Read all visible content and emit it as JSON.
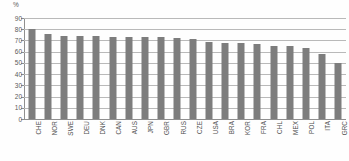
{
  "chart_data": {
    "type": "bar",
    "title": "",
    "subtitle": "",
    "xlabel": "",
    "ylabel": "%",
    "unit_label": "%",
    "ylim": [
      0,
      90
    ],
    "y_ticks": [
      0,
      10,
      20,
      30,
      40,
      50,
      60,
      70,
      80,
      90
    ],
    "y_tick_labels": [
      "0",
      "10",
      "20",
      "30",
      "40",
      "50",
      "60",
      "70",
      "80",
      "90"
    ],
    "grid": true,
    "grid_axis": "y",
    "legend": false,
    "legend_position": "none",
    "bar_color": "#7d7d7d",
    "grid_color": "#b9b9b9",
    "axis_color": "#8f8f8f",
    "categories": [
      "CHE",
      "NOR",
      "SWE",
      "DEU",
      "DNK",
      "CAN",
      "AUS",
      "JPN",
      "GBR",
      "RUS",
      "CZE",
      "USA",
      "BRA",
      "KOR",
      "FRA",
      "CHL",
      "MEX",
      "POL",
      "ITA",
      "GRC"
    ],
    "values": [
      80,
      76,
      74,
      74,
      74,
      73.5,
      73.5,
      73,
      73,
      72.5,
      71,
      69,
      68,
      68,
      67,
      65,
      65,
      63,
      57.5,
      50
    ],
    "series": [
      {
        "name": "",
        "values": [
          80,
          76,
          74,
          74,
          74,
          73.5,
          73.5,
          73,
          73,
          72.5,
          71,
          69,
          68,
          68,
          67,
          65,
          65,
          63,
          57.5,
          50
        ]
      }
    ]
  }
}
